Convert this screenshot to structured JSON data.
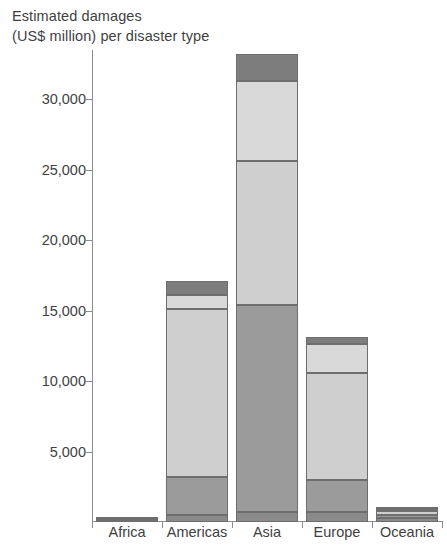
{
  "chart_data": {
    "type": "bar",
    "subtype": "stacked-bar",
    "title": "Estimated damages (US$ million) per disaster type",
    "title_lines": [
      "Estimated damages",
      "(US$ million) per disaster type"
    ],
    "xlabel": "",
    "ylabel": "",
    "categories": [
      "Africa",
      "Americas",
      "Asia",
      "Europe",
      "Oceania"
    ],
    "ylim": [
      0,
      33500
    ],
    "yticks": [
      5000,
      10000,
      15000,
      20000,
      25000,
      30000
    ],
    "ytick_labels": [
      "5,000",
      "10,000",
      "15,000",
      "20,000",
      "25,000",
      "30,000"
    ],
    "grid": false,
    "legend": "none",
    "series": [
      {
        "name": "segment-1",
        "color": "#8a8a8a",
        "values": [
          120,
          500,
          700,
          700,
          300
        ]
      },
      {
        "name": "segment-2",
        "color": "#9b9b9b",
        "values": [
          40,
          2700,
          14700,
          2300,
          200
        ]
      },
      {
        "name": "segment-3",
        "color": "#cfcfcf",
        "values": [
          30,
          11900,
          10200,
          7600,
          300
        ]
      },
      {
        "name": "segment-4",
        "color": "#d9d9d9",
        "values": [
          10,
          1000,
          5700,
          2000,
          100
        ]
      },
      {
        "name": "segment-5",
        "color": "#7d7d7d",
        "values": [
          10,
          1000,
          1900,
          500,
          50
        ]
      }
    ],
    "totals": [
      210,
      16100,
      33200,
      13100,
      950
    ],
    "stroke_color": "#6e6e6e",
    "axis_color": "#8d8d8d"
  },
  "axis": {
    "tick_0": "5,000",
    "tick_1": "10,000",
    "tick_2": "15,000",
    "tick_3": "20,000",
    "tick_4": "25,000",
    "tick_5": "30,000"
  },
  "categories": {
    "c0": "Africa",
    "c1": "Americas",
    "c2": "Asia",
    "c3": "Europe",
    "c4": "Oceania"
  },
  "title": {
    "line1": "Estimated damages",
    "line2": "(US$ million) per disaster type"
  }
}
